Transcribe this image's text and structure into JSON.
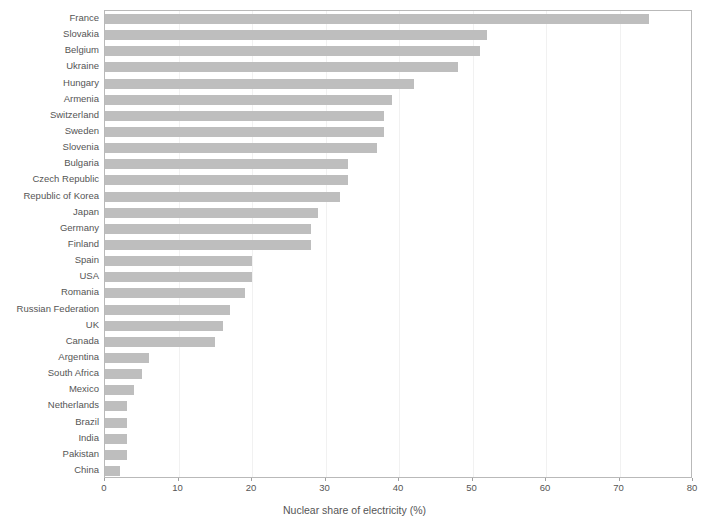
{
  "chart_data": {
    "type": "bar",
    "orientation": "horizontal",
    "title": "",
    "xlabel": "Nuclear share of electricity (%)",
    "ylabel": "",
    "xlim": [
      0,
      80
    ],
    "xticks": [
      0,
      10,
      20,
      30,
      40,
      50,
      60,
      70,
      80
    ],
    "xtick_labels": [
      "0",
      "10",
      "20",
      "30",
      "40",
      "50",
      "60",
      "70",
      "80"
    ],
    "grid": true,
    "grid_axis": "x",
    "legend": null,
    "bar_color": "#bebebe",
    "categories": [
      "France",
      "Slovakia",
      "Belgium",
      "Ukraine",
      "Hungary",
      "Armenia",
      "Switzerland",
      "Sweden",
      "Slovenia",
      "Bulgaria",
      "Czech Republic",
      "Republic of Korea",
      "Japan",
      "Germany",
      "Finland",
      "Spain",
      "USA",
      "Romania",
      "Russian Federation",
      "UK",
      "Canada",
      "Argentina",
      "South Africa",
      "Mexico",
      "Netherlands",
      "Brazil",
      "India",
      "Pakistan",
      "China"
    ],
    "values": [
      74,
      52,
      51,
      48,
      42,
      39,
      38,
      38,
      37,
      33,
      33,
      32,
      29,
      28,
      28,
      20,
      20,
      19,
      17,
      16,
      15,
      6,
      5,
      4,
      3,
      3,
      3,
      3,
      2
    ]
  },
  "axis": {
    "x_title": "Nuclear share of electricity (%)"
  }
}
